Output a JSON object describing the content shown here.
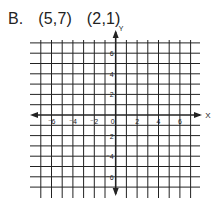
{
  "problem": {
    "label": "B.",
    "points": [
      "(5,7)",
      "(2,1)"
    ]
  },
  "grid": {
    "x_axis_label": "X",
    "y_axis_label": "Y",
    "x_min": -7,
    "x_max": 7,
    "y_min": -7,
    "y_max": 7,
    "x_tick_labels": [
      "-6",
      "-4",
      "-2",
      "0",
      "2",
      "4",
      "6"
    ],
    "y_tick_labels": [
      "6",
      "4",
      "2",
      "-2",
      "-4",
      "-6"
    ]
  }
}
